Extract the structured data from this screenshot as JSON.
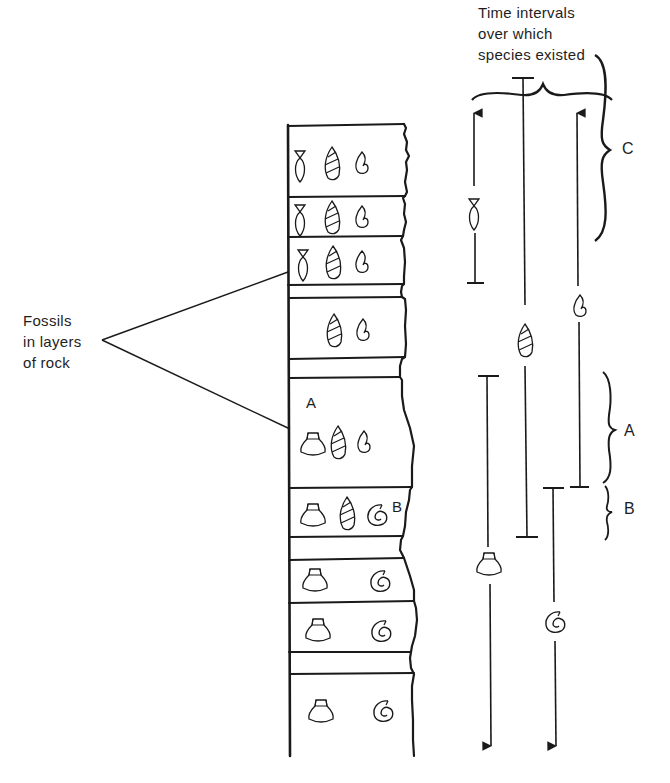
{
  "title": {
    "lines": [
      "Time intervals",
      "over which",
      "species existed"
    ]
  },
  "callout": {
    "lines": [
      "Fossils",
      "in layers",
      "of rock"
    ]
  },
  "column": {
    "layer_labels": {
      "A": "A",
      "B": "B"
    },
    "layers": [
      {
        "id": "L1",
        "fossils": [
          "fish",
          "spiral-snail",
          "hook-shell"
        ]
      },
      {
        "id": "L2",
        "fossils": [
          "fish",
          "spiral-snail",
          "hook-shell"
        ]
      },
      {
        "id": "L3",
        "fossils": [
          "fish",
          "spiral-snail",
          "hook-shell"
        ]
      },
      {
        "id": "L4",
        "fossils": [
          "spiral-snail",
          "hook-shell"
        ]
      },
      {
        "id": "L5",
        "label": "A",
        "fossils": [
          "scallop",
          "spiral-snail",
          "hook-shell"
        ]
      },
      {
        "id": "L6",
        "label": "B",
        "fossils": [
          "scallop",
          "spiral-snail",
          "ammonite"
        ]
      },
      {
        "id": "L7",
        "fossils": [
          "scallop",
          "ammonite"
        ]
      },
      {
        "id": "L8",
        "fossils": [
          "scallop",
          "ammonite"
        ]
      },
      {
        "id": "L9",
        "fossils": [
          "scallop",
          "ammonite"
        ]
      }
    ]
  },
  "ranges": [
    {
      "species": "fish",
      "top": "arrow (continues)",
      "bottom": "bar"
    },
    {
      "species": "spiral-snail",
      "top": "bar",
      "bottom": "bar"
    },
    {
      "species": "hook-shell",
      "top": "arrow (continues)",
      "bottom": "bar"
    },
    {
      "species": "scallop",
      "top": "bar",
      "bottom": "arrow (continues)"
    },
    {
      "species": "ammonite",
      "top": "bar",
      "bottom": "arrow (continues)"
    }
  ],
  "braces": {
    "C": "C",
    "A": "A",
    "B": "B"
  },
  "colors": {
    "ink": "#1a1a1a",
    "background": "#ffffff"
  }
}
